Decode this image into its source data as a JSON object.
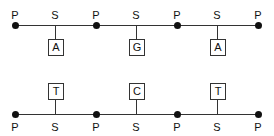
{
  "diagram": {
    "top_strand": {
      "phosphate_label": "P",
      "sugar_label": "S",
      "bases": [
        "A",
        "G",
        "A"
      ]
    },
    "bottom_strand": {
      "phosphate_label": "P",
      "sugar_label": "S",
      "bases": [
        "T",
        "C",
        "T"
      ]
    }
  }
}
